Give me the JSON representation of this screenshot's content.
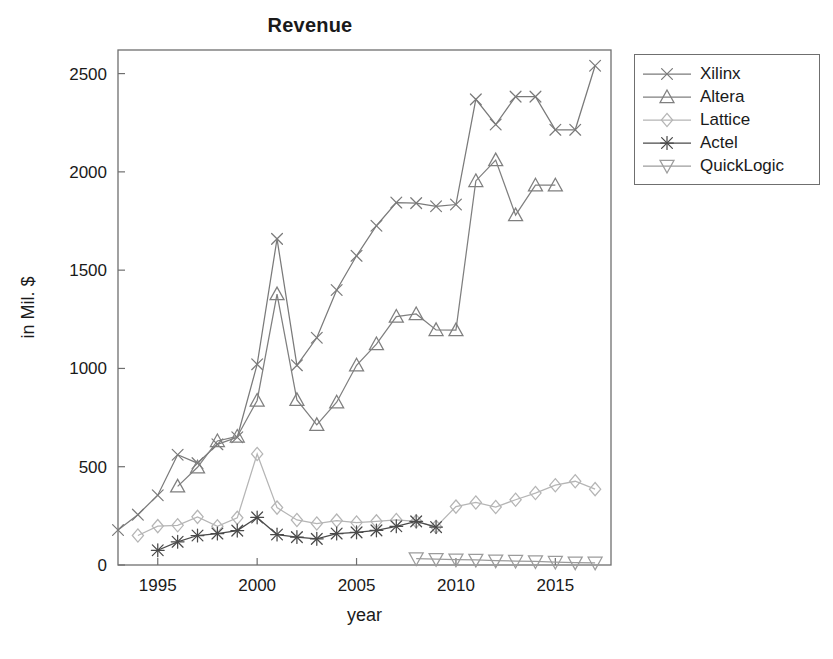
{
  "figure": {
    "title": "Revenue",
    "background": "#ffffff"
  },
  "legend": {
    "position": "right",
    "border_color": "#6f6f6f",
    "entries": [
      {
        "label": "Xilinx",
        "marker": "x-cross",
        "color": "#7a7a7a"
      },
      {
        "label": "Altera",
        "marker": "triangle-up",
        "color": "#7f7f7f"
      },
      {
        "label": "Lattice",
        "marker": "diamond",
        "color": "#b5b5b5"
      },
      {
        "label": "Actel",
        "marker": "asterisk",
        "color": "#4a4a4a"
      },
      {
        "label": "QuickLogic",
        "marker": "triangle-down",
        "color": "#9c9c9c"
      }
    ]
  },
  "axes": {
    "xlabel": "year",
    "ylabel": "in Mil. $",
    "xticks": [
      "1995",
      "2000",
      "2005",
      "2010",
      "2015"
    ],
    "yticks": [
      "0",
      "500",
      "1000",
      "1500",
      "2000",
      "2500"
    ],
    "xlim": [
      1993,
      2017.8
    ],
    "ylim": [
      0,
      2620
    ],
    "grid": false
  },
  "chart_data": {
    "type": "line",
    "title": "Revenue",
    "xlabel": "year",
    "ylabel": "in Mil. $",
    "xlim": [
      1993,
      2017.8
    ],
    "ylim": [
      0,
      2620
    ],
    "xticks": [
      1995,
      2000,
      2005,
      2010,
      2015
    ],
    "yticks": [
      0,
      500,
      1000,
      1500,
      2000,
      2500
    ],
    "grid": false,
    "legend_position": "right",
    "series": [
      {
        "name": "Xilinx",
        "marker": "x-cross",
        "color": "#7a7a7a",
        "x": [
          1993,
          1994,
          1995,
          1996,
          1997,
          1998,
          1999,
          2000,
          2001,
          2002,
          2003,
          2004,
          2005,
          2006,
          2007,
          2008,
          2009,
          2010,
          2011,
          2012,
          2013,
          2014,
          2015,
          2016,
          2017
        ],
        "y": [
          178,
          256,
          355,
          561,
          518,
          614,
          650,
          1021,
          1659,
          1016,
          1156,
          1399,
          1573,
          1726,
          1844,
          1841,
          1825,
          1834,
          2369,
          2241,
          2383,
          2383,
          2214,
          2214,
          2540
        ]
      },
      {
        "name": "Altera",
        "marker": "triangle-up",
        "color": "#7f7f7f",
        "x": [
          1996,
          1997,
          1998,
          1999,
          2000,
          2001,
          2002,
          2003,
          2004,
          2005,
          2006,
          2007,
          2008,
          2009,
          2010,
          2011,
          2012,
          2013,
          2014,
          2015
        ],
        "y": [
          400,
          497,
          631,
          654,
          837,
          1378,
          840,
          713,
          828,
          1016,
          1124,
          1264,
          1277,
          1196,
          1195,
          1954,
          2060,
          1780,
          1932,
          1932
        ]
      },
      {
        "name": "Lattice",
        "marker": "diamond",
        "color": "#b5b5b5",
        "x": [
          1994,
          1995,
          1996,
          1997,
          1998,
          1999,
          2000,
          2001,
          2002,
          2003,
          2004,
          2005,
          2006,
          2007,
          2008,
          2009,
          2010,
          2011,
          2012,
          2013,
          2014,
          2015,
          2016,
          2017
        ],
        "y": [
          150,
          198,
          202,
          245,
          197,
          240,
          565,
          292,
          229,
          211,
          226,
          216,
          222,
          229,
          222,
          194,
          297,
          318,
          295,
          332,
          366,
          406,
          426,
          386
        ]
      },
      {
        "name": "Actel",
        "marker": "asterisk",
        "color": "#4a4a4a",
        "x": [
          1995,
          1996,
          1997,
          1998,
          1999,
          2000,
          2001,
          2002,
          2003,
          2004,
          2005,
          2006,
          2007,
          2008,
          2009
        ],
        "y": [
          75,
          118,
          150,
          160,
          175,
          242,
          155,
          142,
          133,
          160,
          166,
          176,
          197,
          222,
          193
        ]
      },
      {
        "name": "QuickLogic",
        "marker": "triangle-down",
        "color": "#9c9c9c",
        "x": [
          2008,
          2009,
          2010,
          2011,
          2012,
          2013,
          2014,
          2015,
          2016,
          2017
        ],
        "y": [
          33,
          30,
          27,
          26,
          22,
          20,
          18,
          15,
          12,
          11
        ]
      }
    ]
  }
}
